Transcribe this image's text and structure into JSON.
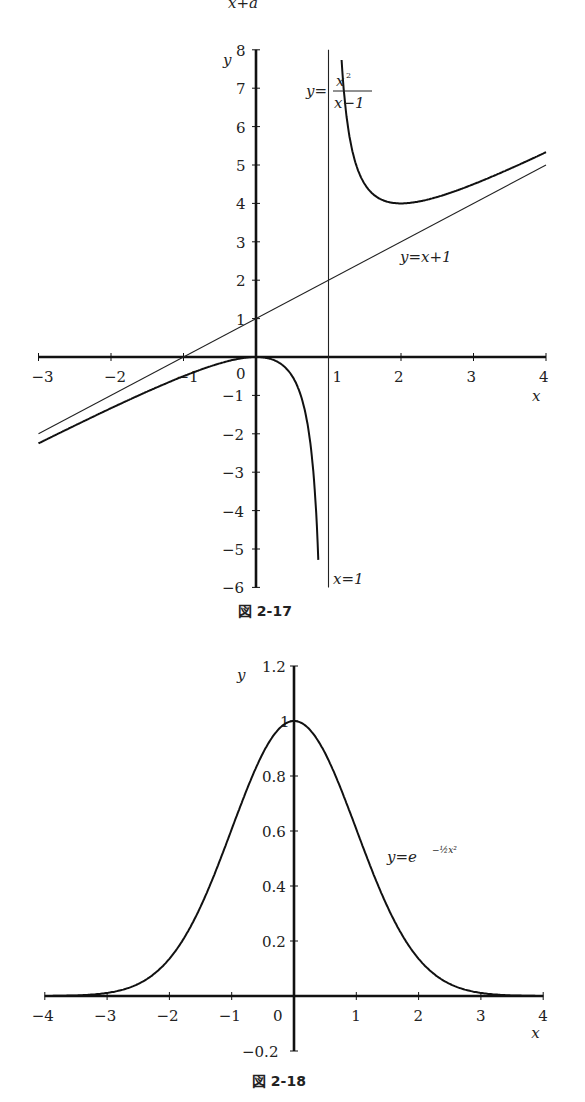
{
  "header_fragment": "x+a",
  "chart_data": [
    {
      "type": "line",
      "caption": "図 2-17",
      "xlabel": "x",
      "ylabel": "y",
      "xlim": [
        -3,
        4
      ],
      "ylim": [
        -6,
        8
      ],
      "xticks": [
        -3,
        -2,
        -1,
        0,
        1,
        2,
        3,
        4
      ],
      "xtick_labels": [
        "−3",
        "−2",
        "−1",
        "0",
        "1",
        "2",
        "3",
        "4"
      ],
      "yticks": [
        -6,
        -5,
        -4,
        -3,
        -2,
        -1,
        1,
        2,
        3,
        4,
        5,
        6,
        7,
        8
      ],
      "ytick_labels": [
        "−6",
        "−5",
        "−4",
        "−3",
        "−2",
        "−1",
        "1",
        "2",
        "3",
        "4",
        "5",
        "6",
        "7",
        "8"
      ],
      "grid": false,
      "series": [
        {
          "name": "curve",
          "label": "y=x²/(x−1)",
          "label_parts": {
            "lhs": "y=",
            "num": "x",
            "sup": "2",
            "den": "x−1"
          },
          "expr": "x^2/(x-1)",
          "x_range": [
            -3,
            4
          ],
          "asymptote_x": 1
        },
        {
          "name": "oblique-asymptote",
          "label": "y=x+1",
          "expr": "x+1",
          "x_range": [
            -3,
            4
          ]
        },
        {
          "name": "vertical-asymptote",
          "label": "x=1",
          "x": 1
        }
      ]
    },
    {
      "type": "line",
      "caption": "図 2-18",
      "xlabel": "x",
      "ylabel": "y",
      "xlim": [
        -4,
        4
      ],
      "ylim": [
        -0.2,
        1.2
      ],
      "xticks": [
        -4,
        -3,
        -2,
        -1,
        0,
        1,
        2,
        3,
        4
      ],
      "xtick_labels": [
        "−4",
        "−3",
        "−2",
        "−1",
        "0",
        "1",
        "2",
        "3",
        "4"
      ],
      "yticks": [
        -0.2,
        0.2,
        0.4,
        0.6,
        0.8,
        1,
        1.2
      ],
      "ytick_labels": [
        "−0.2",
        "0.2",
        "0.4",
        "0.6",
        "0.8",
        "1",
        "1.2"
      ],
      "grid": false,
      "series": [
        {
          "name": "gaussian",
          "label": "y=e^(−½x²)",
          "label_parts": {
            "lhs": "y=e",
            "exp": "−½x²"
          },
          "expr": "exp(-x^2/2)",
          "x_range": [
            -4,
            4
          ]
        }
      ]
    }
  ]
}
